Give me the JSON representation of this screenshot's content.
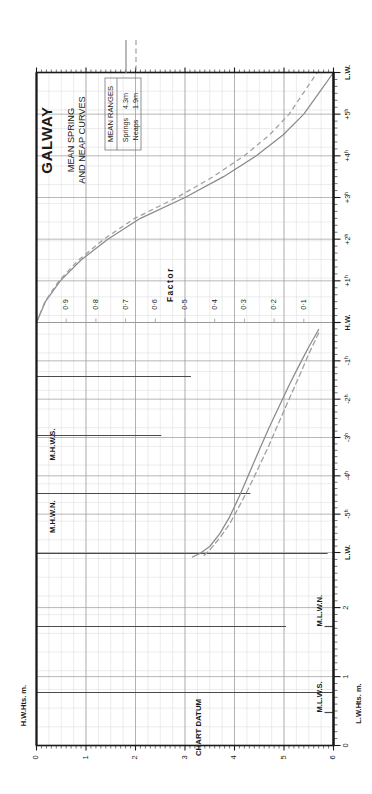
{
  "title": "GALWAY",
  "subtitle_line1": "MEAN SPRING",
  "subtitle_line2": "AND NEAP CURVES",
  "legend": {
    "header": "MEAN RANGES",
    "rows": [
      {
        "label": "Springs",
        "value": "4.3m",
        "style": "solid"
      },
      {
        "label": "Neaps",
        "value": "1.9m",
        "style": "dashed"
      }
    ]
  },
  "axes": {
    "left_label": "H.W.Hts. m.",
    "right_label": "L.W.Hts. m.",
    "factor_label": "Factor",
    "datum_label": "CHART DATUM",
    "hw_label": "H.W.",
    "lw_label": "L.W.",
    "height_ticks": [
      0,
      1,
      2,
      3,
      4,
      5,
      6
    ],
    "lw_height_ticks": [
      0,
      1,
      2
    ],
    "factor_ticks": [
      "0·9",
      "0·8",
      "0·7",
      "0·6",
      "0·5",
      "0·4",
      "0·3",
      "0·2",
      "0·1"
    ],
    "factor_values": [
      0.9,
      0.8,
      0.7,
      0.6,
      0.5,
      0.4,
      0.3,
      0.2,
      0.1
    ],
    "time_ticks_top": [
      "L.W.",
      "+5ʰ",
      "+4ʰ",
      "+3ʰ",
      "+2ʰ",
      "+1ʰ",
      "H.W."
    ],
    "time_ticks_bottom": [
      "-1ʰ",
      "-2ʰ",
      "-3ʰ",
      "-4ʰ",
      "-5ʰ",
      "L.W."
    ]
  },
  "datum_markers": [
    {
      "name": "M.H.W.S.",
      "side": "left",
      "height": 5.1
    },
    {
      "name": "M.H.W.N.",
      "side": "left",
      "height": 3.9
    },
    {
      "name": "M.L.W.N.",
      "side": "right",
      "height": 2.0
    },
    {
      "name": "M.L.W.S.",
      "side": "right",
      "height": 0.6
    }
  ],
  "colors": {
    "frame": "#1a1a1a",
    "grid_major": "#9a9a9a",
    "grid_minor": "#d8d8d8",
    "curve_spring": "#8a8a8a",
    "curve_neap": "#9e9e9e",
    "marker_line": "#4a4a4a",
    "text": "#1a1a1a"
  },
  "chart_data": {
    "type": "line",
    "xlabel": "Time relative to High Water (hours)",
    "ylabel": "Factor / Height (m)",
    "grid": true,
    "legend_position": "top-left",
    "factor_curve": {
      "name": "Tidal factor curve",
      "xlabel": "Hours from H.W.",
      "ylabel": "Factor",
      "x": [
        0,
        0.5,
        1,
        1.5,
        2,
        2.5,
        3,
        3.5,
        4,
        4.5,
        5,
        5.5,
        6
      ],
      "y": [
        1.0,
        0.97,
        0.92,
        0.85,
        0.76,
        0.65,
        0.5,
        0.37,
        0.26,
        0.17,
        0.1,
        0.05,
        0.0
      ],
      "xlim": [
        0,
        6.2
      ],
      "ylim": [
        0,
        1.0
      ]
    },
    "range_curves": {
      "xlabel": "H.W. Height (m)",
      "ylabel": "L.W. Height (m)",
      "series": [
        {
          "name": "Springs",
          "mean_range_m": 4.3,
          "style": "solid",
          "hw_heights": [
            5.7,
            5.5,
            5.3,
            5.1,
            4.9,
            4.7,
            4.5,
            4.3,
            4.1,
            3.9,
            3.7,
            3.5,
            3.3,
            3.15
          ],
          "lw_heights": [
            0.1,
            0.35,
            0.62,
            0.9,
            1.2,
            1.5,
            1.82,
            2.15,
            2.48,
            2.78,
            3.02,
            3.2,
            3.3,
            3.35
          ]
        },
        {
          "name": "Neaps",
          "mean_range_m": 1.9,
          "style": "dashed",
          "hw_heights": [
            5.7,
            5.5,
            5.3,
            5.1,
            4.9,
            4.7,
            4.5,
            4.3,
            4.1,
            3.9,
            3.7,
            3.5,
            3.35
          ],
          "lw_heights": [
            0.15,
            0.45,
            0.78,
            1.1,
            1.42,
            1.75,
            2.05,
            2.35,
            2.62,
            2.88,
            3.08,
            3.25,
            3.35
          ]
        }
      ]
    },
    "mean_ranges": {
      "springs_m": 4.3,
      "neaps_m": 1.9
    },
    "tidal_levels": {
      "MHWS": 5.1,
      "MHWN": 3.9,
      "MLWN": 2.0,
      "MLWS": 0.6,
      "CHART_DATUM": 0.0
    }
  }
}
